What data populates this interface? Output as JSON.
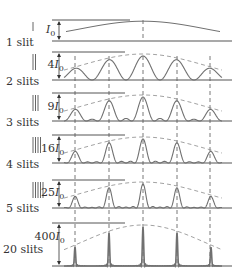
{
  "colors": {
    "curve": "#707070",
    "axis": "#555555",
    "envelope": "#8a8a8a",
    "text": "#333333"
  },
  "panels": [
    {
      "slits": 1,
      "label": "1 slit",
      "peak_label": "I",
      "peak_coef": "",
      "baseline_y": 41,
      "top_y": 20,
      "label_y": 36,
      "plabel_y": 23
    },
    {
      "slits": 2,
      "label": "2 slits",
      "peak_label": "4I",
      "peak_coef": "4",
      "baseline_y": 80,
      "top_y": 52,
      "label_y": 75,
      "plabel_y": 58
    },
    {
      "slits": 3,
      "label": "3 slits",
      "peak_label": "9I",
      "peak_coef": "9",
      "baseline_y": 121,
      "top_y": 93,
      "label_y": 116,
      "plabel_y": 100
    },
    {
      "slits": 4,
      "label": "4 slits",
      "peak_label": "16I",
      "peak_coef": "16",
      "baseline_y": 163,
      "top_y": 135,
      "label_y": 158,
      "plabel_y": 142
    },
    {
      "slits": 5,
      "label": "5 slits",
      "peak_label": "25I",
      "peak_coef": "25",
      "baseline_y": 208,
      "top_y": 180,
      "label_y": 202,
      "plabel_y": 186
    },
    {
      "slits": 20,
      "label": "20 slits",
      "peak_label": "400I",
      "peak_coef": "400",
      "baseline_y": 266,
      "top_y": 223,
      "label_y": 243,
      "plabel_y": 230
    }
  ],
  "peak_positions_x": [
    75,
    109,
    143,
    177,
    210
  ],
  "subscript": "0"
}
